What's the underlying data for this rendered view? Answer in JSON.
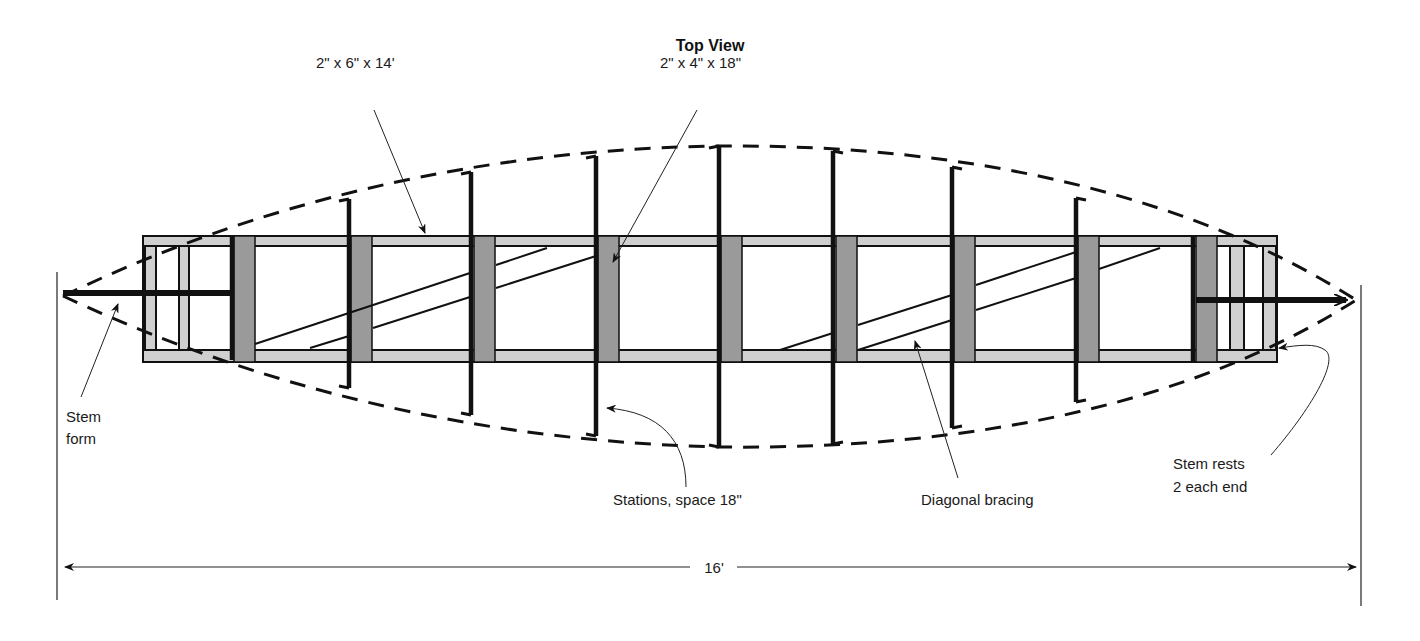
{
  "title": "Top View",
  "labels": {
    "rail": "2\" x 6\" x 14'",
    "block": "2\" x 4\" x 18\"",
    "stem_form_line1": "Stem",
    "stem_form_line2": "form",
    "stations": "Stations, space 18\"",
    "bracing": "Diagonal bracing",
    "stem_rests_line1": "Stem rests",
    "stem_rests_line2": "2 each end",
    "overall_length": "16'"
  },
  "colors": {
    "ink": "#111111",
    "rail_fill": "#cfcfcf",
    "block_fill": "#9a9a9a",
    "rest_fill": "#d0d0d0"
  },
  "frame": {
    "x1": 143,
    "x2": 1277,
    "top": 236,
    "top_inner": 246,
    "bottom_inner": 350,
    "bottom": 362
  },
  "stations": [
    {
      "x": 232,
      "top": 236,
      "bottom": 360,
      "block_x": 234
    },
    {
      "x": 349,
      "top": 199,
      "bottom": 388,
      "block_x": 351
    },
    {
      "x": 471,
      "top": 172,
      "bottom": 415,
      "block_x": 474
    },
    {
      "x": 596,
      "top": 156,
      "bottom": 436,
      "block_x": 598
    },
    {
      "x": 719,
      "top": 146,
      "bottom": 447,
      "block_x": 721
    },
    {
      "x": 833,
      "top": 151,
      "bottom": 444,
      "block_x": 836
    },
    {
      "x": 952,
      "top": 167,
      "bottom": 428,
      "block_x": 954
    },
    {
      "x": 1076,
      "top": 198,
      "bottom": 402,
      "block_x": 1078
    },
    {
      "x": 1193,
      "top": 236,
      "bottom": 362,
      "block_x": 1196
    }
  ],
  "stem_rests": [
    {
      "x": 145,
      "w": 11
    },
    {
      "x": 179,
      "w": 10
    },
    {
      "x": 1230,
      "w": 14
    },
    {
      "x": 1263,
      "w": 13
    }
  ],
  "bracing": [
    {
      "x1": 255,
      "y1": 344,
      "x2": 470,
      "y2": 273
    },
    {
      "x1": 496,
      "y1": 265,
      "x2": 547,
      "y2": 248
    },
    {
      "x1": 310,
      "y1": 348,
      "x2": 349,
      "y2": 336
    },
    {
      "x1": 373,
      "y1": 328,
      "x2": 470,
      "y2": 297
    },
    {
      "x1": 496,
      "y1": 288,
      "x2": 596,
      "y2": 256
    },
    {
      "x1": 780,
      "y1": 350,
      "x2": 833,
      "y2": 333
    },
    {
      "x1": 858,
      "y1": 325,
      "x2": 952,
      "y2": 295
    },
    {
      "x1": 976,
      "y1": 285,
      "x2": 1076,
      "y2": 252
    },
    {
      "x1": 858,
      "y1": 350,
      "x2": 952,
      "y2": 320
    },
    {
      "x1": 976,
      "y1": 310,
      "x2": 1076,
      "y2": 278
    },
    {
      "x1": 1099,
      "y1": 269,
      "x2": 1160,
      "y2": 248
    }
  ],
  "dimension": {
    "x1": 63,
    "x2": 1358,
    "y": 567,
    "ext_top_left": 272,
    "ext_top_right": 285,
    "ext_bottom": 600
  }
}
